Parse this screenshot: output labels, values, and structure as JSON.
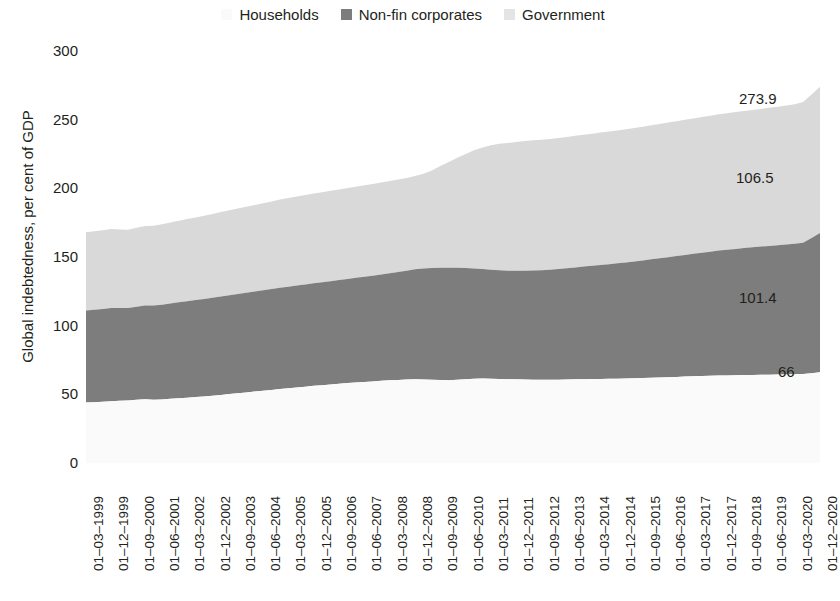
{
  "chart_data": {
    "type": "area",
    "stacked": true,
    "title": "",
    "xlabel": "",
    "ylabel": "Global indebtedness, per cent of GDP",
    "ylim": [
      0,
      300
    ],
    "yticks": [
      0,
      50,
      100,
      150,
      200,
      250,
      300
    ],
    "grid": false,
    "legend_position": "top-center",
    "legend": [
      "Households",
      "Non-fin corporates",
      "Government"
    ],
    "colors": {
      "Households": "#fafafa",
      "Non-fin corporates": "#7d7d7d",
      "Government": "#d9d9d9",
      "text": "#231f20"
    },
    "x_tick_labels": [
      "01–03–1999",
      "01–12–1999",
      "01–09–2000",
      "01–06–2001",
      "01–03–2002",
      "01–12–2002",
      "01–09–2003",
      "01–06–2004",
      "01–03–2005",
      "01–12–2005",
      "01–09–2006",
      "01–06–2007",
      "01–03–2008",
      "01–12–2008",
      "01–09–2009",
      "01–06–2010",
      "01–03–2011",
      "01–12–2011",
      "01–09–2012",
      "01–06–2013",
      "01–03–2014",
      "01–12–2014",
      "01–09–2015",
      "01–06–2016",
      "01–03–2017",
      "01–12–2017",
      "01–09–2018",
      "01–06–2019",
      "01–03–2020",
      "01–12–2020"
    ],
    "x_tick_step_quarters": 3,
    "n_points": 88,
    "series": [
      {
        "name": "Households",
        "color": "#fafafa",
        "values": [
          44.0,
          44.3,
          44.6,
          45.0,
          45.3,
          45.6,
          46.0,
          46.5,
          46.0,
          46.3,
          46.8,
          47.2,
          47.6,
          48.0,
          48.5,
          49.0,
          49.6,
          50.2,
          50.8,
          51.4,
          52.0,
          52.6,
          53.2,
          53.8,
          54.4,
          55.0,
          55.6,
          56.2,
          56.7,
          57.2,
          57.7,
          58.2,
          58.6,
          59.0,
          59.4,
          59.8,
          60.2,
          60.5,
          60.8,
          61.0,
          60.8,
          60.6,
          60.4,
          60.2,
          60.6,
          61.0,
          61.3,
          61.5,
          61.4,
          61.2,
          61.0,
          60.9,
          60.8,
          60.7,
          60.6,
          60.6,
          60.7,
          60.8,
          60.9,
          61.0,
          61.1,
          61.2,
          61.3,
          61.4,
          61.5,
          61.7,
          61.9,
          62.1,
          62.3,
          62.5,
          62.7,
          62.9,
          63.1,
          63.3,
          63.5,
          63.7,
          63.8,
          63.9,
          64.0,
          64.1,
          64.2,
          64.3,
          64.4,
          64.5,
          64.6,
          64.8,
          65.3,
          66.0
        ]
      },
      {
        "name": "Non-fin corporates",
        "color": "#7d7d7d",
        "values": [
          67.0,
          67.2,
          67.5,
          67.8,
          67.5,
          67.3,
          67.8,
          68.2,
          68.6,
          69.0,
          69.4,
          69.8,
          70.2,
          70.6,
          71.0,
          71.4,
          71.7,
          72.0,
          72.3,
          72.6,
          72.9,
          73.2,
          73.5,
          73.8,
          74.0,
          74.2,
          74.4,
          74.6,
          74.9,
          75.2,
          75.5,
          75.8,
          76.2,
          76.6,
          77.0,
          77.5,
          78.0,
          78.6,
          79.2,
          80.0,
          80.8,
          81.4,
          81.8,
          82.0,
          81.6,
          81.0,
          80.4,
          79.8,
          79.4,
          79.2,
          79.0,
          79.0,
          79.2,
          79.5,
          79.8,
          80.2,
          80.6,
          81.0,
          81.5,
          82.0,
          82.5,
          83.0,
          83.5,
          84.0,
          84.5,
          85.0,
          85.6,
          86.2,
          86.8,
          87.4,
          88.0,
          88.6,
          89.2,
          89.8,
          90.4,
          91.0,
          91.5,
          92.0,
          92.5,
          93.0,
          93.4,
          93.8,
          94.2,
          94.6,
          95.0,
          95.6,
          98.5,
          101.4
        ]
      },
      {
        "name": "Government",
        "color": "#d9d9d9",
        "values": [
          57.0,
          57.2,
          57.4,
          57.6,
          57.2,
          57.0,
          57.5,
          57.8,
          58.2,
          58.6,
          59.0,
          59.4,
          59.8,
          60.2,
          60.6,
          61.0,
          61.4,
          61.8,
          62.2,
          62.6,
          63.0,
          63.4,
          63.8,
          64.2,
          64.5,
          64.8,
          65.1,
          65.4,
          65.6,
          65.8,
          66.0,
          66.2,
          66.4,
          66.6,
          66.8,
          67.0,
          67.2,
          67.4,
          67.6,
          68.0,
          69.0,
          71.0,
          74.0,
          77.0,
          80.0,
          83.0,
          86.0,
          88.5,
          90.5,
          92.0,
          93.0,
          93.8,
          94.4,
          94.8,
          95.0,
          95.2,
          95.4,
          95.6,
          95.8,
          96.0,
          96.2,
          96.4,
          96.6,
          96.8,
          97.0,
          97.2,
          97.4,
          97.6,
          97.8,
          98.0,
          98.2,
          98.4,
          98.6,
          98.8,
          99.0,
          99.2,
          99.4,
          99.6,
          99.8,
          100.0,
          100.2,
          100.5,
          100.8,
          101.2,
          101.6,
          102.5,
          104.5,
          106.5
        ]
      }
    ],
    "annotations": [
      {
        "name": "total-value",
        "text": "273.9",
        "value": 273.9
      },
      {
        "name": "government-value",
        "text": "106.5",
        "value": 106.5
      },
      {
        "name": "corporates-value",
        "text": "101.4",
        "value": 101.4
      },
      {
        "name": "households-value",
        "text": "66",
        "value": 66
      }
    ]
  }
}
